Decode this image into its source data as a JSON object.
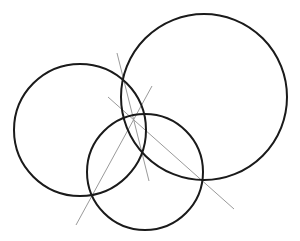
{
  "diagram": {
    "width": 300,
    "height": 241,
    "background": "#ffffff",
    "circle_color": "#1a1a1a",
    "line_color": "#9a9a9a",
    "circles": [
      {
        "name": "left-circle",
        "cx": 80,
        "cy": 130,
        "r": 66
      },
      {
        "name": "large-right-circle",
        "cx": 204,
        "cy": 97,
        "r": 83
      },
      {
        "name": "bottom-circle",
        "cx": 145,
        "cy": 172,
        "r": 58
      }
    ],
    "lines": [
      {
        "name": "bisector-line-a",
        "x1": 117,
        "y1": 53,
        "x2": 149,
        "y2": 181
      },
      {
        "name": "bisector-line-b",
        "x1": 76,
        "y1": 225,
        "x2": 152,
        "y2": 86
      },
      {
        "name": "bisector-line-c",
        "x1": 108,
        "y1": 97,
        "x2": 234,
        "y2": 209
      }
    ]
  }
}
